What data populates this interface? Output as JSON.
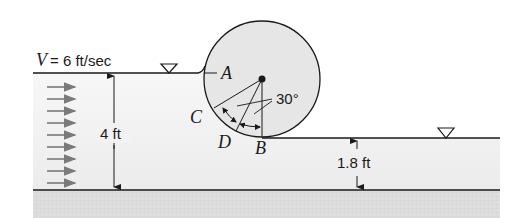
{
  "figure": {
    "velocity_label_symbol": "V",
    "velocity_label_value": "= 6 ft/sec",
    "upstream_depth_label": "4 ft",
    "downstream_depth_label": "1.8 ft",
    "angle_label": "30°",
    "points": {
      "A": "A",
      "B": "B",
      "C": "C",
      "D": "D"
    },
    "flow_arrow_count": 9,
    "free_surface_markers": [
      "upstream-free-surface",
      "downstream-free-surface"
    ]
  },
  "colors": {
    "line": "#1a1a1a",
    "cylinder_fill": "#e6e6e6",
    "water_fill": "#f0f0f0",
    "ground_fill": "#d9d9d9",
    "arrow": "#7a7a7a"
  }
}
